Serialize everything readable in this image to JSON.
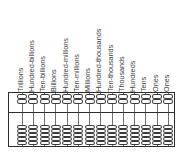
{
  "diagram": {
    "kind": "soroban-abacus-place-value-chart",
    "rod_count": 14,
    "upper_beads_per_rod": 2,
    "lower_beads_per_rod": 5,
    "frame_color": "#2e2e2e",
    "bead_outline_color": "#3a3a3a",
    "bead_fill_color": "#fefefe",
    "rod_wire_color": "#6f6f6f",
    "label_color": "#3d3d3d",
    "background_color": "#ffffff",
    "place_values": [
      {
        "label": "Trillions"
      },
      {
        "label": "Hundred-billions"
      },
      {
        "label": "Ten-billions"
      },
      {
        "label": "Billions"
      },
      {
        "label": "Hundred-millions"
      },
      {
        "label": "Ten-millions"
      },
      {
        "label": "Millions"
      },
      {
        "label": "Hundred-thousands"
      },
      {
        "label": "Ten-thousands"
      },
      {
        "label": "Thousands"
      },
      {
        "label": "Hundreds"
      },
      {
        "label": "Tens"
      },
      {
        "label": "Ones"
      }
    ],
    "extra_place_value": {
      "label": "Ones"
    }
  }
}
